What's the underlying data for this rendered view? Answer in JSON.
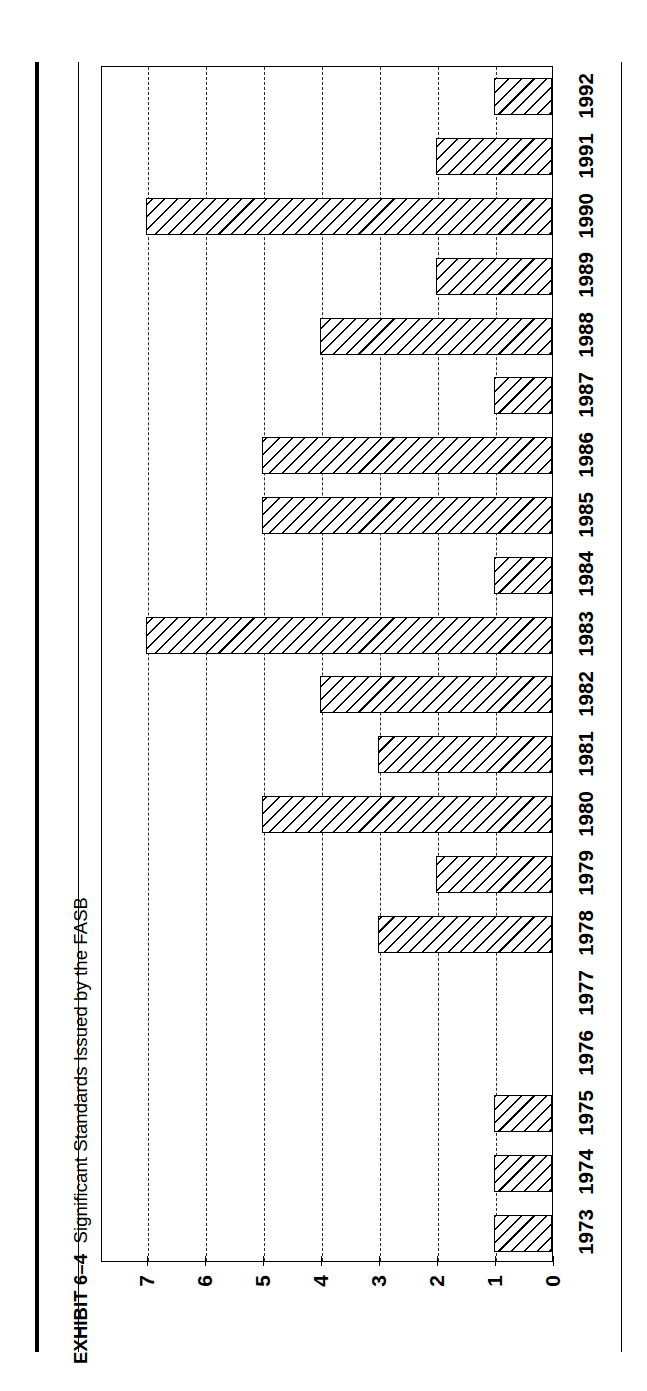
{
  "exhibit": {
    "label": "EXHIBIT 6–4",
    "title": "Significant Standards Issued by the FASB"
  },
  "chart_data": {
    "type": "bar",
    "orientation": "horizontal",
    "title": "Significant Standards Issued by the FASB",
    "xlabel": "",
    "ylabel": "",
    "categories": [
      "1973",
      "1974",
      "1975",
      "1976",
      "1977",
      "1978",
      "1979",
      "1980",
      "1981",
      "1982",
      "1983",
      "1984",
      "1985",
      "1986",
      "1987",
      "1988",
      "1989",
      "1990",
      "1991",
      "1992"
    ],
    "values": [
      1,
      2,
      7,
      2,
      4,
      1,
      5,
      5,
      1,
      7,
      4,
      3,
      5,
      2,
      3,
      0,
      0,
      1,
      1,
      1
    ],
    "value_ticks": [
      "0",
      "1",
      "2",
      "3",
      "4",
      "5",
      "6",
      "7"
    ],
    "value_axis_order_on_screen": [
      "7",
      "6",
      "5",
      "4",
      "3",
      "2",
      "1",
      "0"
    ],
    "xlim": [
      0,
      7.8
    ],
    "grid": true,
    "grid_style": "dashed",
    "legend": "none",
    "bar_fill": "diagonal-hatch",
    "colors": {
      "ink": "#000000",
      "background": "#ffffff",
      "gridline": "#2b2b2b"
    }
  }
}
